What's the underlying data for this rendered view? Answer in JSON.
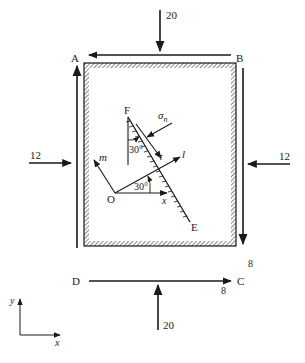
{
  "diagram": {
    "corners": {
      "A": "A",
      "B": "B",
      "C": "C",
      "D": "D"
    },
    "loads": {
      "top": "20",
      "bottom": "20",
      "left": "12",
      "right": "12",
      "shear_right": "8",
      "shear_bottom": "8"
    },
    "inner": {
      "F": "F",
      "E": "E",
      "O": "O",
      "sigma_n": "σ",
      "sigma_n_sub": "n",
      "tau": "τ",
      "l_axis": "l",
      "m_axis": "m",
      "x_axis": "x",
      "angle_at_O": "30°",
      "angle_at_F": "30°"
    },
    "axes": {
      "y": "y",
      "x": "x"
    },
    "colors": {
      "ink": "#1a1a1a",
      "background": "#ffffff"
    }
  }
}
